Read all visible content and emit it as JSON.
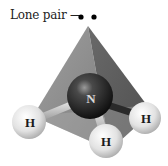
{
  "figure": {
    "label": "Lone pair —",
    "central_atom": "N",
    "hydrogen_atoms": [
      "H",
      "H",
      "H"
    ],
    "colors": {
      "pyramid_left_face": "#8f8f8f",
      "pyramid_right_face": "#5f5f5f",
      "pyramid_base": "#a9a9a9",
      "nitrogen": "#222222",
      "hydrogen": "#e6e6e6",
      "lone_pair_dots": "#000000"
    }
  }
}
